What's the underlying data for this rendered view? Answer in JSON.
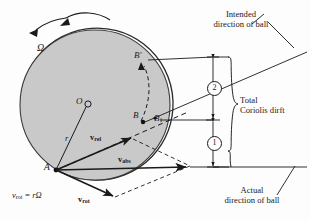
{
  "figure": {
    "type": "physics-vector-diagram",
    "background_color": "#fdfdfd",
    "disk_fill": "#c9c9c9",
    "stroke_color": "#1a1a1a"
  },
  "labels": {
    "omega": "Ω",
    "center_point": "O",
    "radius": "r",
    "point_a": "A",
    "point_b": "B",
    "point_b1": "B",
    "point_b1_sub": "1",
    "point_b_prime": "B′",
    "v_rel": "v",
    "v_rel_sub": "rel",
    "v_abs": "v",
    "v_abs_sub": "abs",
    "v_rot": "v",
    "v_rot_sub": "rot",
    "formula_lhs": "v",
    "formula_lhs_sub": "rot",
    "formula_rhs": "= rΩ",
    "intended_line1": "Intended",
    "intended_line2": "direction of ball",
    "actual_line1": "Actual",
    "actual_line2": "direction of ball",
    "total_line1": "Total",
    "total_line2": "Coriolis dirft",
    "callout_two": "2",
    "callout_one": "1"
  },
  "geometry": {
    "disk_center_x": 95,
    "disk_center_y": 105,
    "disk_radius": 75,
    "point_o": [
      83,
      105
    ],
    "point_a": [
      55,
      170
    ],
    "point_b": [
      140,
      121
    ],
    "point_b1": [
      155,
      124
    ],
    "point_b_prime": [
      143,
      63
    ],
    "v_rel_tip": [
      133,
      141
    ],
    "v_abs_tip": [
      188,
      167
    ],
    "v_rot_tip": [
      114,
      198
    ],
    "dimension_x": 213,
    "dim_top_y": 57,
    "dim_mid_y": 120,
    "dim_bottom_y": 167
  },
  "icons": {
    "rotation_arrow": "curved-arrow-icon",
    "dimension_arrows": "double-headed-arrow-icon"
  }
}
